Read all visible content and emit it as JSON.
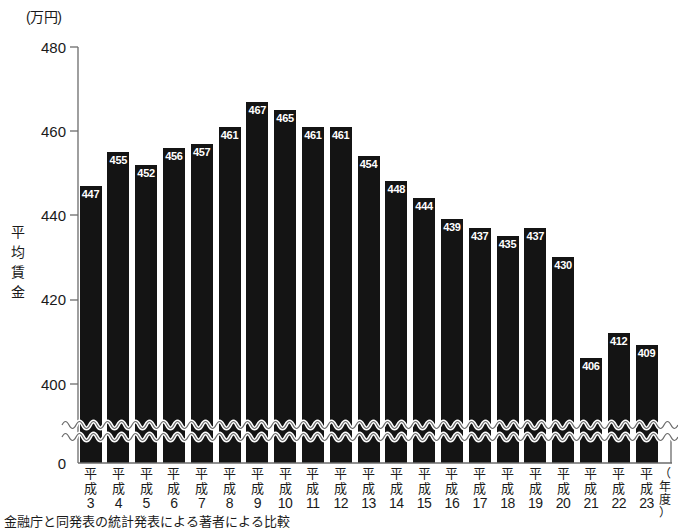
{
  "chart_data": {
    "type": "bar",
    "title": "",
    "unit_label": "(万円)",
    "ylabel": "平均賃金",
    "xlabel": "(年度)",
    "categories": [
      "平成3",
      "平成4",
      "平成5",
      "平成6",
      "平成7",
      "平成8",
      "平成9",
      "平成10",
      "平成11",
      "平成12",
      "平成13",
      "平成14",
      "平成15",
      "平成16",
      "平成17",
      "平成18",
      "平成19",
      "平成20",
      "平成21",
      "平成22",
      "平成23"
    ],
    "category_era": "平成",
    "category_numbers": [
      "3",
      "4",
      "5",
      "6",
      "7",
      "8",
      "9",
      "10",
      "11",
      "12",
      "13",
      "14",
      "15",
      "16",
      "17",
      "18",
      "19",
      "20",
      "21",
      "22",
      "23"
    ],
    "values": [
      447,
      455,
      452,
      456,
      457,
      461,
      467,
      465,
      461,
      461,
      454,
      448,
      444,
      439,
      437,
      435,
      437,
      430,
      406,
      412,
      409
    ],
    "ytick_labels": [
      "480",
      "460",
      "440",
      "420",
      "400",
      "0"
    ],
    "ytick_values": [
      480,
      460,
      440,
      420,
      400,
      0
    ],
    "ylim": [
      0,
      480
    ],
    "axis_break": true,
    "axis_break_note": "波線による軸の省略",
    "grid": false,
    "legend": null,
    "bar_color": "#141414",
    "label_color": "#ffffff",
    "axis_color": "#6b6b6b",
    "background_color": "#ffffff"
  },
  "caption": {
    "text": "金融庁と同発表の統計発表による著者による比較"
  }
}
